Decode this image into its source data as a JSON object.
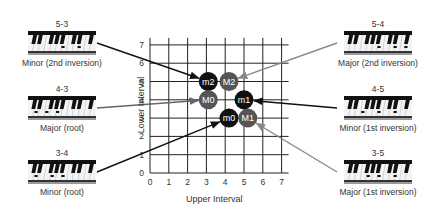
{
  "grid": {
    "x_axis_label": "Upper Interval",
    "y_axis_label": "Lower Interval",
    "x_ticks": [
      "0",
      "1",
      "2",
      "3",
      "4",
      "5",
      "6",
      "7"
    ],
    "y_ticks": [
      "0",
      "1",
      "2",
      "3",
      "4",
      "5",
      "6",
      "7"
    ],
    "origin_px": [
      150,
      173
    ],
    "step_x": 18.8,
    "step_y": 18.3
  },
  "nodes": [
    {
      "id": "m2",
      "label": "m2",
      "x": 3.1,
      "y": 5,
      "color": "#111111"
    },
    {
      "id": "M2",
      "label": "M2",
      "x": 4.2,
      "y": 5,
      "color": "#555555"
    },
    {
      "id": "M0",
      "label": "M0",
      "x": 3.1,
      "y": 4,
      "color": "#555555"
    },
    {
      "id": "m1",
      "label": "m1",
      "x": 5.0,
      "y": 4,
      "color": "#111111"
    },
    {
      "id": "m0",
      "label": "m0",
      "x": 4.2,
      "y": 3,
      "color": "#111111"
    },
    {
      "id": "M1",
      "label": "M1",
      "x": 5.2,
      "y": 3,
      "color": "#555555"
    }
  ],
  "chords": [
    {
      "id": "c53",
      "interval": "5-3",
      "name": "Minor (2nd inversion)",
      "side": "left",
      "row": 0,
      "target": "m2",
      "arrow_color": "#111111",
      "notes": [
        7,
        10
      ]
    },
    {
      "id": "c43",
      "interval": "4-3",
      "name": "Major (root)",
      "side": "left",
      "row": 1,
      "target": "M0",
      "arrow_color": "#666666",
      "notes": [
        2,
        4,
        6
      ]
    },
    {
      "id": "c34",
      "interval": "3-4",
      "name": "Minor (root)",
      "side": "left",
      "row": 2,
      "target": "m0",
      "arrow_color": "#111111",
      "notes": [
        2,
        5,
        7
      ]
    },
    {
      "id": "c54",
      "interval": "5-4",
      "name": "Major (2nd inversion)",
      "side": "right",
      "row": 0,
      "target": "M2",
      "arrow_color": "#888888",
      "notes": [
        7,
        10,
        12
      ]
    },
    {
      "id": "c45",
      "interval": "4-5",
      "name": "Minor (1st inversion)",
      "side": "right",
      "row": 1,
      "target": "m1",
      "arrow_color": "#111111",
      "notes": [
        4,
        7,
        10
      ]
    },
    {
      "id": "c35",
      "interval": "3-5",
      "name": "Major (1st inversion)",
      "side": "right",
      "row": 2,
      "target": "M1",
      "arrow_color": "#888888",
      "notes": [
        5,
        7,
        10
      ]
    }
  ]
}
